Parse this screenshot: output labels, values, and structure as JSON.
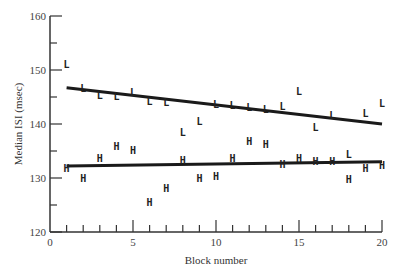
{
  "chart_data": {
    "type": "scatter",
    "title": "",
    "xlabel": "Block number",
    "ylabel": "Median ISI (msec)",
    "xlim": [
      0,
      20
    ],
    "ylim": [
      120,
      160
    ],
    "x_ticks_major": [
      0,
      5,
      10,
      15,
      20
    ],
    "x_ticks_minor_step": 1,
    "y_ticks_major": [
      120,
      130,
      140,
      150,
      160
    ],
    "y_ticks_minor_step": 5,
    "grid": false,
    "legend": null,
    "x": [
      1,
      2,
      3,
      4,
      5,
      6,
      7,
      8,
      9,
      10,
      11,
      12,
      13,
      14,
      15,
      16,
      17,
      18,
      19,
      20
    ],
    "series": [
      {
        "name": "L",
        "marker": "L",
        "values": [
          151.1,
          146.7,
          145.4,
          145.2,
          146.0,
          144.3,
          144.1,
          138.5,
          140.6,
          143.7,
          143.5,
          143.1,
          142.8,
          143.3,
          146.1,
          139.4,
          141.7,
          134.4,
          142.0,
          143.9
        ],
        "trendline": {
          "x": [
            1,
            20
          ],
          "y": [
            146.7,
            140.0
          ]
        }
      },
      {
        "name": "H",
        "marker": "H",
        "values": [
          131.9,
          130.0,
          133.7,
          135.9,
          135.2,
          125.6,
          128.1,
          133.3,
          130.0,
          130.4,
          133.7,
          136.9,
          136.3,
          132.6,
          133.7,
          133.1,
          133.1,
          129.8,
          131.9,
          132.4
        ],
        "trendline": {
          "x": [
            1,
            20
          ],
          "y": [
            132.2,
            133.0
          ]
        }
      }
    ],
    "annotations": []
  },
  "labels": {
    "xlabel": "Block number",
    "ylabel": "Median ISI (msec)"
  }
}
